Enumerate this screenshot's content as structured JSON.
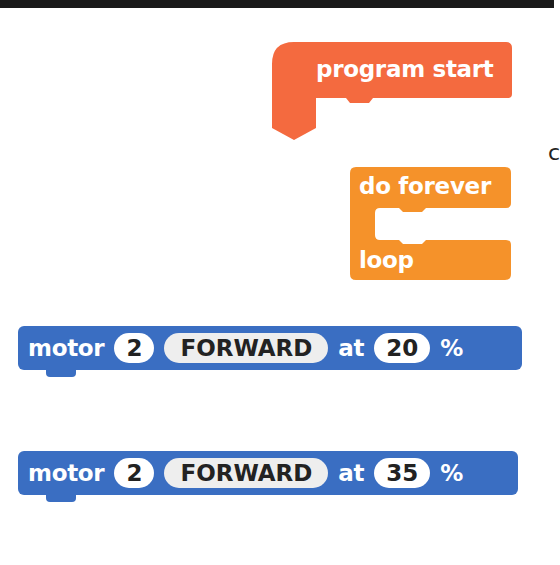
{
  "colors": {
    "program_start": "#f46a3f",
    "loop": "#f5922a",
    "motor": "#3a6ec2",
    "text": "#ffffff",
    "field_bg": "#ffffff",
    "dropdown_bg": "#eeeeee",
    "top_bar": "#1a1a1a"
  },
  "blocks": {
    "program_start": {
      "label": "program start"
    },
    "do_forever": {
      "top_label": "do forever",
      "bottom_label": "loop"
    },
    "motor_blocks": [
      {
        "label": "motor",
        "port": "2",
        "direction": "FORWARD",
        "at_label": "at",
        "speed": "20",
        "unit": "%"
      },
      {
        "label": "motor",
        "port": "2",
        "direction": "FORWARD",
        "at_label": "at",
        "speed": "35",
        "unit": "%"
      }
    ]
  },
  "edge_text": "c"
}
